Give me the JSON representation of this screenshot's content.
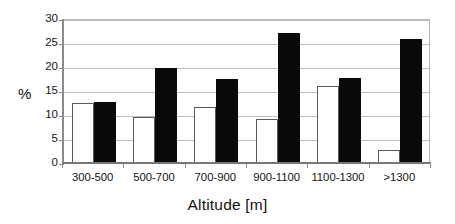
{
  "chart_data": {
    "type": "bar",
    "title": "",
    "subtitle": "",
    "xlabel": "Altitude [m]",
    "ylabel": "%",
    "categories": [
      "300-500",
      "500-700",
      "700-900",
      "900-1100",
      "1100-1300",
      ">1300"
    ],
    "series": [
      {
        "name": "open",
        "fill": "#ffffff",
        "values": [
          12.8,
          9.8,
          11.8,
          9.4,
          16.2,
          3.0
        ]
      },
      {
        "name": "filled",
        "fill": "#0a0a0a",
        "values": [
          12.9,
          19.9,
          17.7,
          27.3,
          17.9,
          26.1
        ]
      }
    ],
    "ylim": [
      0,
      30
    ],
    "yticks": [
      0,
      5,
      10,
      15,
      20,
      25,
      30
    ],
    "ytick_labels": [
      "0",
      "5",
      "10",
      "15",
      "20",
      "25",
      "30"
    ],
    "grid": true,
    "grid_axis": "y",
    "legend": "none",
    "axis_color": "#8a8a8a",
    "grid_color": "#bdbdbd",
    "text_color": "#141414"
  }
}
